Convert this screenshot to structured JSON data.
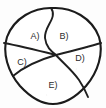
{
  "figure": {
    "type": "geometry-diagram",
    "background_color": "#fdfdfd",
    "stroke_color": "#1b1b1b",
    "label_color": "#2b2b2b",
    "outer_shape": "rounded triangular shield (flat-curved top, rounded bottom apex)",
    "region_count": 5,
    "regions": [
      {
        "id": "A",
        "label": "A)",
        "position": "upper-left",
        "cx": 35,
        "cy": 36
      },
      {
        "id": "B",
        "label": "B)",
        "position": "upper-right",
        "cx": 64,
        "cy": 36
      },
      {
        "id": "C",
        "label": "C)",
        "position": "left",
        "cx": 22,
        "cy": 63
      },
      {
        "id": "D",
        "label": "D)",
        "position": "right",
        "cx": 80,
        "cy": 59
      },
      {
        "id": "E",
        "label": "E)",
        "position": "bottom",
        "cx": 53,
        "cy": 86
      }
    ],
    "dividers": [
      {
        "name": "a-b-divider",
        "from": "top-edge",
        "to": "center"
      },
      {
        "name": "a-c-divider",
        "from": "left-edge",
        "to": "center"
      },
      {
        "name": "b-d-divider",
        "from": "center",
        "to": "right-edge"
      },
      {
        "name": "c-e-divider",
        "from": "center",
        "to": "lower-left-edge"
      },
      {
        "name": "d-e-divider",
        "from": "center",
        "to": "lower-right-edge"
      }
    ],
    "vertex": {
      "x": 55,
      "y": 55
    }
  }
}
